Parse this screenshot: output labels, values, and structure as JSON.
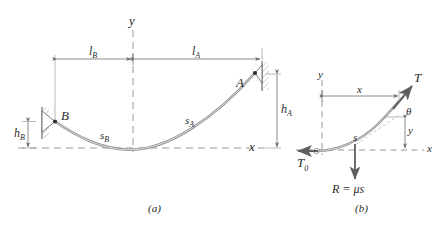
{
  "figure": {
    "title_caption_a": "(a)",
    "title_caption_b": "(b)",
    "colors": {
      "line": "#6e6e6e",
      "cable": "#8a8a8a",
      "text": "#2b2b2b",
      "hatch": "#9a9a9a",
      "background": "#ffffff"
    }
  },
  "panel_a": {
    "caption": "(a)",
    "axis_y_label": "y",
    "axis_x_label": "x",
    "support_a_label": "A",
    "support_b_label": "B",
    "arc_a_label": "s",
    "arc_a_sub": "A",
    "arc_b_label": "s",
    "arc_b_sub": "B",
    "span_b_label": "l",
    "span_b_sub": "B",
    "span_a_label": "l",
    "span_a_sub": "A",
    "height_a_label": "h",
    "height_a_sub": "A",
    "height_b_label": "h",
    "height_b_sub": "B"
  },
  "panel_b": {
    "caption": "(b)",
    "axis_y_label": "y",
    "axis_x_label": "x",
    "tension_label": "T",
    "tension_zero_label": "T",
    "tension_zero_sub": "0",
    "angle_label": "θ",
    "arc_label": "s",
    "dim_x_label": "x",
    "dim_y_label": "y",
    "load_label": "R = μs"
  }
}
